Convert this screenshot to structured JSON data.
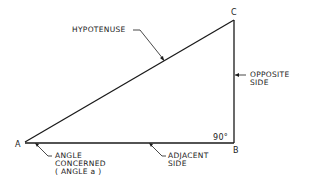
{
  "diagram": {
    "type": "right-triangle",
    "vertices": {
      "A": {
        "label": "A"
      },
      "B": {
        "label": "B"
      },
      "C": {
        "label": "C"
      }
    },
    "right_angle_label": "90°",
    "labels": {
      "hypotenuse": "HYPOTENUSE",
      "opposite_line1": "OPPOSITE",
      "opposite_line2": "SIDE",
      "adjacent_line1": "ADJACENT",
      "adjacent_line2": "SIDE",
      "angle_line1": "ANGLE",
      "angle_line2": "CONCERNED",
      "angle_line3": "( ANGLE  a )"
    },
    "colors": {
      "stroke": "#1a1a1a",
      "background": "#ffffff"
    }
  }
}
